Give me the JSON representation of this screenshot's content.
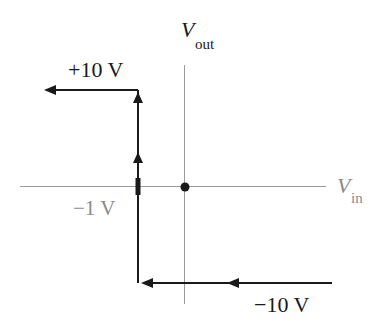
{
  "diagram": {
    "type": "hysteresis-transfer-characteristic",
    "axes": {
      "x_label": {
        "main": "V",
        "sub": "in"
      },
      "y_label": {
        "main": "V",
        "sub": "out"
      }
    },
    "labels": {
      "upper_level": "+10 V",
      "lower_level": "−10 V",
      "threshold": "−1 V"
    },
    "colors": {
      "axis": "#9a9a9a",
      "curve": "#1a1a1a",
      "gray_label": "#8a8a8a",
      "text": "#1a1a1a"
    }
  }
}
